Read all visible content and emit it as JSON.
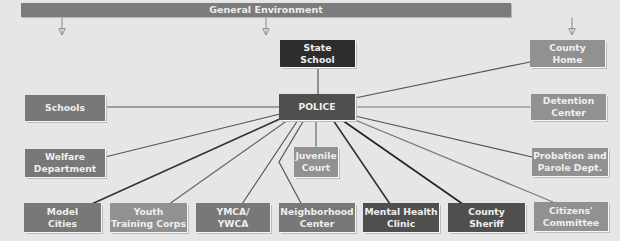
{
  "header": {
    "label": "General Environment"
  },
  "nodes": {
    "state_school": "State\nSchool",
    "police": "POLICE",
    "county_home": "County\nHome",
    "schools": "Schools",
    "detention_center": "Detention\nCenter",
    "welfare_department": "Welfare\nDepartment",
    "juvenile_court": "Juvenile\nCourt",
    "probation_parole": "Probation and\nParole Dept.",
    "model_cities": "Model\nCities",
    "youth_training_corps": "Youth\nTraining Corps",
    "ymca_ywca": "YMCA/\nYWCA",
    "neighborhood_center": "Neighborhood\nCenter",
    "mental_health_clinic": "Mental Health\nClinic",
    "county_sheriff": "County\nSheriff",
    "citizens_committee": "Citizens'\nCommittee"
  },
  "colors": {
    "background": "#e6e6e6",
    "box_medium": "#787878",
    "box_light": "#919191",
    "box_dark": "#4f4f4f",
    "box_black": "#2d2d2d",
    "line": "#5a5a5a"
  }
}
